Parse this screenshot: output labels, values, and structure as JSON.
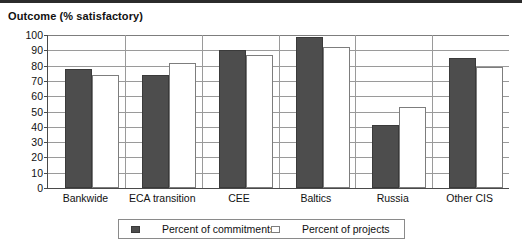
{
  "chart_data": {
    "type": "bar",
    "title": "Outcome (% satisfactory)",
    "xlabel": "",
    "ylabel": "",
    "ylim": [
      0,
      100
    ],
    "ytick_step": 10,
    "yticks": [
      100,
      90,
      80,
      70,
      60,
      50,
      40,
      30,
      20,
      10,
      0
    ],
    "grid": true,
    "grid_axis": "y",
    "legend_position": "bottom-center",
    "categories": [
      "Bankwide",
      "ECA transition",
      "CEE",
      "Baltics",
      "Russia",
      "Other CIS"
    ],
    "series": [
      {
        "name": "Percent of commitments",
        "color": "#4d4d4d",
        "values": [
          78,
          74,
          90,
          99,
          41,
          85
        ]
      },
      {
        "name": "Percent of projects",
        "color": "#ffffff",
        "values": [
          74,
          82,
          87,
          92,
          53,
          79
        ]
      }
    ]
  },
  "legend": {
    "entries": [
      {
        "label": "Percent of commitments",
        "swatch": "dark-swatch"
      },
      {
        "label": "Percent of projects",
        "swatch": "light-swatch"
      }
    ]
  }
}
